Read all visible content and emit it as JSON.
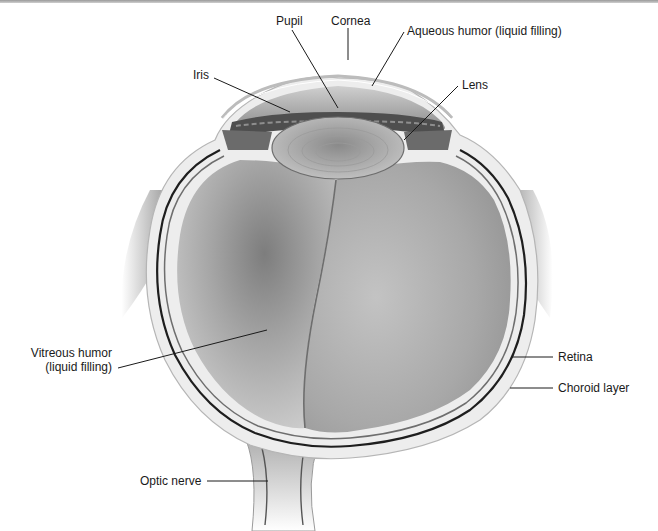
{
  "diagram": {
    "labels": {
      "pupil": "Pupil",
      "cornea": "Cornea",
      "aqueous_humor": "Aqueous humor (liquid filling)",
      "iris": "Iris",
      "lens": "Lens",
      "vitreous_humor_line1": "Vitreous humor",
      "vitreous_humor_line2": "(liquid filling)",
      "retina": "Retina",
      "choroid_layer": "Choroid layer",
      "optic_nerve": "Optic nerve"
    },
    "colors": {
      "background": "#ffffff",
      "text": "#1a1a1a",
      "leader_line": "#1a1a1a",
      "vitreous_fill": "#b8b8b8",
      "vitreous_shadow": "#8c8c8c",
      "sclera": "#e6e6e6",
      "choroid": "#1e1e1e",
      "lens_fill": "#a9a9a9",
      "iris_fill": "#4a4a4a",
      "aqueous_fill": "#9e9e9e",
      "top_bar": "#a8a8a8"
    }
  }
}
